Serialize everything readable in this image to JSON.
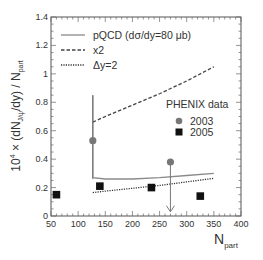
{
  "chart_data": {
    "type": "line",
    "title": "",
    "xlabel": "N",
    "xlabel_sub": "part",
    "ylabel": "10⁴ × (dN",
    "ylabel_sub": "J/ψ",
    "ylabel_mid": "/dy) / N",
    "ylabel_sub2": "part",
    "ylabel_sup": "4",
    "xlim": [
      50,
      400
    ],
    "ylim": [
      0,
      1.4
    ],
    "xticks": [
      50,
      100,
      150,
      200,
      250,
      300,
      350,
      400
    ],
    "yticks": [
      0,
      0.2,
      0.4,
      0.6,
      0.8,
      1,
      1.2,
      1.4
    ],
    "ytick_labels": [
      "0",
      "0.2",
      "0.4",
      "0.6",
      "0.8",
      "1",
      "1.2",
      "1.4"
    ],
    "grid": false,
    "series": [
      {
        "name": "pQCD (dσ/dy=80 μb)",
        "style": "solid",
        "color": "#8a8a8a",
        "x": [
          127,
          127,
          150,
          200,
          250,
          300,
          350
        ],
        "y": [
          0.85,
          0.27,
          0.26,
          0.26,
          0.27,
          0.285,
          0.3
        ]
      },
      {
        "name": "x2",
        "style": "dashed",
        "color": "#444444",
        "x": [
          127,
          150,
          200,
          250,
          300,
          350
        ],
        "y": [
          0.66,
          0.7,
          0.78,
          0.86,
          0.95,
          1.05
        ]
      },
      {
        "name": "Δy=2",
        "style": "dotted",
        "color": "#333333",
        "x": [
          127,
          150,
          200,
          250,
          300,
          350
        ],
        "y": [
          0.165,
          0.175,
          0.195,
          0.215,
          0.24,
          0.265
        ]
      },
      {
        "name": "2003",
        "style": "marker-circle",
        "color": "#777777",
        "points": [
          {
            "x": 127,
            "y": 0.53,
            "err_low": 0.26,
            "err_high": 0.85
          },
          {
            "x": 270,
            "y": 0.38,
            "upper_limit_arrow_to": 0.03
          }
        ]
      },
      {
        "name": "2005",
        "style": "marker-square",
        "color": "#111111",
        "points": [
          {
            "x": 60,
            "y": 0.15
          },
          {
            "x": 140,
            "y": 0.21
          },
          {
            "x": 235,
            "y": 0.2
          },
          {
            "x": 325,
            "y": 0.14
          }
        ]
      }
    ],
    "legend": {
      "position": "upper-left",
      "entries": [
        "pQCD (dσ/dy=80 μb)",
        "x2",
        "Δy=2"
      ]
    },
    "data_legend": {
      "title": "PHENIX data",
      "position": "middle-right",
      "entries": [
        "2003",
        "2005"
      ]
    }
  }
}
